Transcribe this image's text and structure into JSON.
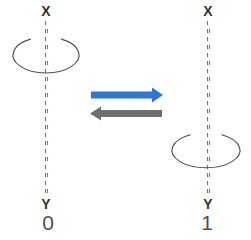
{
  "figure": {
    "left_state": {
      "axis_top_label": "X",
      "axis_bottom_label": "Y",
      "state_label": "0",
      "rotation_position": "top"
    },
    "right_state": {
      "axis_top_label": "X",
      "axis_bottom_label": "Y",
      "state_label": "1",
      "rotation_position": "bottom"
    },
    "icons": {
      "left_rotation": "rotation-loop-icon",
      "right_rotation": "rotation-loop-icon",
      "forward": "arrow-right-icon",
      "backward": "arrow-left-icon"
    },
    "colors": {
      "background": "#ffffff",
      "forward_arrow": "#2e76d9",
      "backward_arrow": "#6f6f6f",
      "axis_line": "#757575",
      "rotation_loop": "#4d4d4d",
      "axis_label": "#333333",
      "state_label": "#4f4f4f"
    }
  }
}
